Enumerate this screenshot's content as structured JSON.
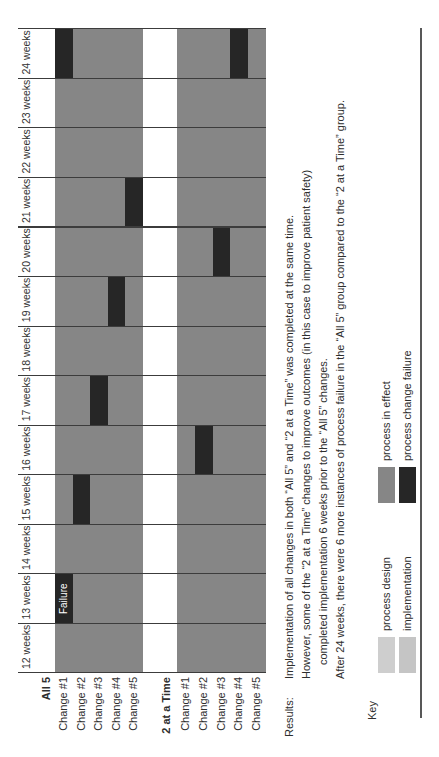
{
  "chart_data": {
    "type": "gantt",
    "x_axis": {
      "unit": "weeks",
      "range": [
        12,
        24
      ],
      "tick_labels": [
        "12 weeks",
        "13 weeks",
        "14 weeks",
        "15 weeks",
        "16 weeks",
        "17 weeks",
        "18 weeks",
        "19 weeks",
        "20 weeks",
        "21 weeks",
        "22 weeks",
        "23 weeks",
        "24 weeks"
      ]
    },
    "groups": [
      {
        "label": "All 5",
        "changes": [
          "Change #1",
          "Change #2",
          "Change #3",
          "Change #4",
          "Change #5"
        ]
      },
      {
        "label": "2 at a Time",
        "changes": [
          "Change #1",
          "Change #2",
          "Change #3",
          "Change #4",
          "Change #5"
        ]
      }
    ],
    "default_cell_state": "process in effect",
    "failures": [
      {
        "group": "All 5",
        "change": 1,
        "week": 13,
        "label": "Failure"
      },
      {
        "group": "All 5",
        "change": 2,
        "week": 15,
        "label": ""
      },
      {
        "group": "All 5",
        "change": 3,
        "week": 17,
        "label": ""
      },
      {
        "group": "All 5",
        "change": 4,
        "week": 19,
        "label": ""
      },
      {
        "group": "All 5",
        "change": 5,
        "week": 21,
        "label": ""
      },
      {
        "group": "All 5",
        "change": 1,
        "week": 24,
        "label": ""
      },
      {
        "group": "2 at a Time",
        "change": 2,
        "week": 16,
        "label": ""
      },
      {
        "group": "2 at a Time",
        "change": 3,
        "week": 20,
        "label": ""
      },
      {
        "group": "2 at a Time",
        "change": 4,
        "week": 24,
        "label": ""
      }
    ],
    "colors": {
      "process_design": "#cecece",
      "implementation": "#c5c5c5",
      "process_in_effect": "#868686",
      "process_change_failure": "#262626",
      "grid_line": "#3c3c3c"
    }
  },
  "results": {
    "label": "Results:",
    "lines": [
      "Implementation of all changes in both “All 5” and “2 at a Time” was completed at the same time.",
      "However, some of the “2 at a Time” changes to improve outcomes (in this case to improve patient safety)",
      "completed implementation 6 weeks prior to the “All 5” changes.",
      "After 24 weeks, there were 6 more instances of process failure in the “All 5” group compared to the “2 at a Time” group."
    ]
  },
  "key": {
    "label": "Key",
    "items": [
      {
        "label": "process design",
        "color": "process_design",
        "row": 0,
        "col": 0
      },
      {
        "label": "implementation",
        "color": "implementation",
        "row": 1,
        "col": 0
      },
      {
        "label": "process in effect",
        "color": "process_in_effect",
        "row": 0,
        "col": 1
      },
      {
        "label": "process change failure",
        "color": "process_change_failure",
        "row": 1,
        "col": 1
      }
    ]
  }
}
